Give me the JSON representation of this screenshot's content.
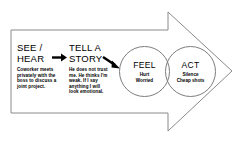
{
  "diagram": {
    "type": "process-arrow-flow",
    "shape": {
      "outline_color": "#8a8a8a",
      "fill_color": "#ffffff",
      "connector_color": "#000000"
    },
    "stages": [
      {
        "id": "see-hear",
        "heading": "SEE /\nHEAR",
        "detail": "Coworker meets privately with the boss to discuss a joint project.",
        "shape": "text"
      },
      {
        "id": "tell-story",
        "heading": "TELL A\nSTORY",
        "detail": "He does not trust me. He thinks I'm weak. If I say anything I will look emotional.",
        "shape": "text"
      },
      {
        "id": "feel",
        "heading": "FEEL",
        "detail": "Hurt\nWorried",
        "shape": "circle"
      },
      {
        "id": "act",
        "heading": "ACT",
        "detail": "Silence\nCheap shots",
        "shape": "circle"
      }
    ],
    "connectors": [
      {
        "id": "see-to-tell",
        "from": "see-hear",
        "to": "tell-story",
        "direction": "right"
      },
      {
        "id": "tell-to-feel",
        "from": "tell-story",
        "to": "feel",
        "direction": "down-right"
      }
    ]
  }
}
